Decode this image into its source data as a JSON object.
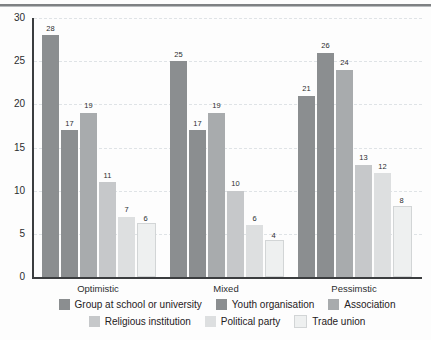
{
  "chart_data": {
    "type": "bar",
    "title": "",
    "subtitle": "",
    "xlabel": "",
    "ylabel": "",
    "ylim": [
      0,
      30
    ],
    "yticks": [
      0,
      5,
      10,
      15,
      20,
      25,
      30
    ],
    "grid": true,
    "grid_style": "dashed-horizontal",
    "legend_position": "bottom",
    "categories": [
      "Optimistic",
      "Mixed",
      "Pessimstic"
    ],
    "series": [
      {
        "name": "Group at school or university",
        "color": "#8b8e90",
        "values": [
          28,
          25,
          21
        ]
      },
      {
        "name": "Youth organisation",
        "color": "#8b8e90",
        "values": [
          17,
          17,
          26
        ]
      },
      {
        "name": "Association",
        "color": "#a8abad",
        "values": [
          19,
          19,
          24
        ]
      },
      {
        "name": "Religious institution",
        "color": "#c6c8ca",
        "values": [
          11,
          10,
          13
        ]
      },
      {
        "name": "Political party",
        "color": "#dddfe0",
        "values": [
          7,
          6,
          12
        ]
      },
      {
        "name": "Trade union",
        "color": "#eef0f0",
        "values": [
          6,
          4,
          8
        ]
      }
    ]
  }
}
